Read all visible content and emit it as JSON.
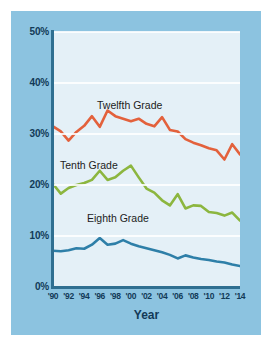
{
  "chart_data": {
    "type": "line",
    "title": "",
    "xlabel": "Year",
    "ylabel": "",
    "xlim": [
      1990,
      2014
    ],
    "ylim": [
      0,
      50
    ],
    "grid": true,
    "legend_position": "inline-labels",
    "y_tick_labels": [
      "0%",
      "10%",
      "20%",
      "30%",
      "40%",
      "50%"
    ],
    "y_tick_values": [
      0,
      10,
      20,
      30,
      40,
      50
    ],
    "x_tick_labels": [
      "'90",
      "'92",
      "'94",
      "'96",
      "'98",
      "'00",
      "'02",
      "'04",
      "'06",
      "'08",
      "'10",
      "'12",
      "'14"
    ],
    "x_tick_values": [
      1990,
      1992,
      1994,
      1996,
      1998,
      2000,
      2002,
      2004,
      2006,
      2008,
      2010,
      2012,
      2014
    ],
    "x": [
      1990,
      1991,
      1992,
      1993,
      1994,
      1995,
      1996,
      1997,
      1998,
      1999,
      2000,
      2001,
      2002,
      2003,
      2004,
      2005,
      2006,
      2007,
      2008,
      2009,
      2010,
      2011,
      2012,
      2013,
      2014
    ],
    "series": [
      {
        "name": "Twelfth Grade",
        "color": "#e3613c",
        "values": [
          31.5,
          30.5,
          28.7,
          30.4,
          31.6,
          33.5,
          31.4,
          34.6,
          33.5,
          33.0,
          32.5,
          33.0,
          32.0,
          31.5,
          33.3,
          30.8,
          30.5,
          29.0,
          28.3,
          27.8,
          27.2,
          26.8,
          25.0,
          28.0,
          26.0
        ]
      },
      {
        "name": "Tenth Grade",
        "color": "#8cb63f",
        "values": [
          20.2,
          18.3,
          19.4,
          20.0,
          20.4,
          21.0,
          22.8,
          21.0,
          21.5,
          22.8,
          23.8,
          21.5,
          19.3,
          18.5,
          17.0,
          16.0,
          18.2,
          15.4,
          16.0,
          15.9,
          14.7,
          14.5,
          14.0,
          14.6,
          13.0
        ]
      },
      {
        "name": "Eighth Grade",
        "color": "#2e7fa8",
        "values": [
          7.1,
          7.0,
          7.2,
          7.6,
          7.5,
          8.3,
          9.6,
          8.3,
          8.5,
          9.2,
          8.5,
          8.0,
          7.6,
          7.2,
          6.8,
          6.3,
          5.6,
          6.2,
          5.8,
          5.5,
          5.3,
          5.0,
          4.8,
          4.4,
          4.1
        ]
      }
    ]
  },
  "labels": {
    "twelfth": "Twelfth Grade",
    "tenth": "Tenth Grade",
    "eighth": "Eighth Grade",
    "xlabel": "Year"
  }
}
